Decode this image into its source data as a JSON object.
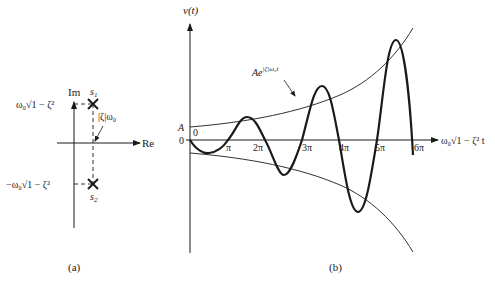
{
  "figure": {
    "panel_a": {
      "caption": "(a)",
      "axes": {
        "imag_label": "Im",
        "real_label": "Re"
      },
      "poles": [
        {
          "name": "s",
          "sub": "1",
          "marker": "cross"
        },
        {
          "name": "s",
          "sub": "2",
          "marker": "cross"
        }
      ],
      "labels": {
        "upper_value": "ω₀√1 − ζ²",
        "lower_value": "−ω₀√1 − ζ²",
        "real_part": "|ζ|ω₀"
      }
    },
    "panel_b": {
      "caption": "(b)",
      "y_axis_label": "v(t)",
      "x_axis_label": "ω₀√1 − ζ² t",
      "envelope_label": "Ae^{|ζ|ω₀t}",
      "envelope_label_base": "Ae",
      "envelope_label_exp": "|ζ|ω₀t",
      "y_tick_A": "A",
      "y_tick_0": "0",
      "origin_label": "0",
      "x_ticks": [
        "π",
        "2π",
        "3π",
        "4π",
        "5π",
        "6π"
      ]
    }
  },
  "colors": {
    "ink": "#1a1a1a",
    "background": "#ffffff"
  }
}
